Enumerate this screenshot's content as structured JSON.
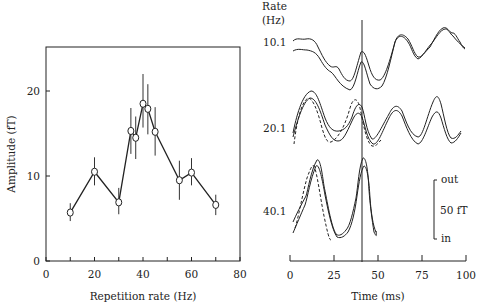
{
  "chart_data": [
    {
      "type": "line",
      "title": "",
      "xlabel": "Repetition rate (Hz)",
      "ylabel": "Amplitude (fT)",
      "xlim": [
        0,
        80
      ],
      "ylim": [
        0,
        25
      ],
      "xticks": [
        0,
        20,
        40,
        60,
        80
      ],
      "xticks_minor": [
        10,
        30,
        50,
        70
      ],
      "yticks": [
        0,
        10,
        20
      ],
      "grid": false,
      "legend": null,
      "marker": "open-circle",
      "error_bars": true,
      "x": [
        10,
        20,
        30,
        35,
        37,
        40,
        42,
        45,
        55,
        60,
        70
      ],
      "series": [
        {
          "name": "Amplitude",
          "values": [
            5.7,
            10.5,
            6.9,
            15.3,
            14.5,
            18.5,
            17.9,
            15.2,
            9.5,
            10.4,
            6.6
          ],
          "err_low": [
            4.7,
            8.9,
            5.5,
            12.6,
            12.0,
            15.7,
            14.9,
            12.4,
            7.2,
            8.9,
            5.4
          ],
          "err_high": [
            6.8,
            12.2,
            8.6,
            18.0,
            17.0,
            22.0,
            20.8,
            18.1,
            11.8,
            12.1,
            7.8
          ]
        }
      ]
    },
    {
      "type": "line",
      "title": "",
      "xlabel": "Time (ms)",
      "ylabel": "",
      "xlim": [
        0,
        100
      ],
      "xticks": [
        0,
        25,
        50,
        75,
        100
      ],
      "grid": false,
      "header_label": "Rate",
      "header_unit": "(Hz)",
      "vertical_marker_ms": 40,
      "scale_bar": {
        "top_label": "out",
        "mid_label": "50 fT",
        "bottom_label": "in",
        "value_fT": 50
      },
      "rows": [
        {
          "rate_label": "10.1",
          "traces": 2,
          "dashed_traces": 0
        },
        {
          "rate_label": "20.1",
          "traces": 2,
          "dashed_traces": 1
        },
        {
          "rate_label": "40.1",
          "traces": 2,
          "dashed_traces": 1
        }
      ]
    }
  ]
}
